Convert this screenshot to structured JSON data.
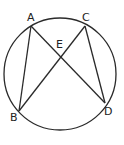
{
  "diagram": {
    "type": "circle-geometry",
    "circle": {
      "cx": 60,
      "cy": 74,
      "r": 56
    },
    "stroke_color": "#2a2a2a",
    "points": {
      "A": {
        "label": "A",
        "x": 31,
        "y": 26
      },
      "B": {
        "label": "B",
        "x": 19,
        "y": 111
      },
      "C": {
        "label": "C",
        "x": 85,
        "y": 26
      },
      "D": {
        "label": "D",
        "x": 105,
        "y": 103
      },
      "E": {
        "label": "E",
        "x": 60,
        "y": 57
      }
    },
    "segments": [
      {
        "from": "A",
        "to": "B"
      },
      {
        "from": "A",
        "to": "D"
      },
      {
        "from": "C",
        "to": "B"
      },
      {
        "from": "C",
        "to": "D"
      }
    ],
    "labels": {
      "A": "A",
      "B": "B",
      "C": "C",
      "D": "D",
      "E": "E"
    }
  }
}
